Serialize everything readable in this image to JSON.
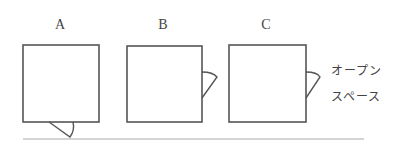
{
  "diagram": {
    "panels": [
      {
        "label": "A",
        "door_position": "bottom"
      },
      {
        "label": "B",
        "door_position": "right"
      },
      {
        "label": "C",
        "door_position": "right"
      }
    ],
    "annotation": {
      "line1": "オープン",
      "line2": "スペース"
    },
    "colors": {
      "stroke": "#555555",
      "baseline": "#aaaaaa"
    }
  }
}
